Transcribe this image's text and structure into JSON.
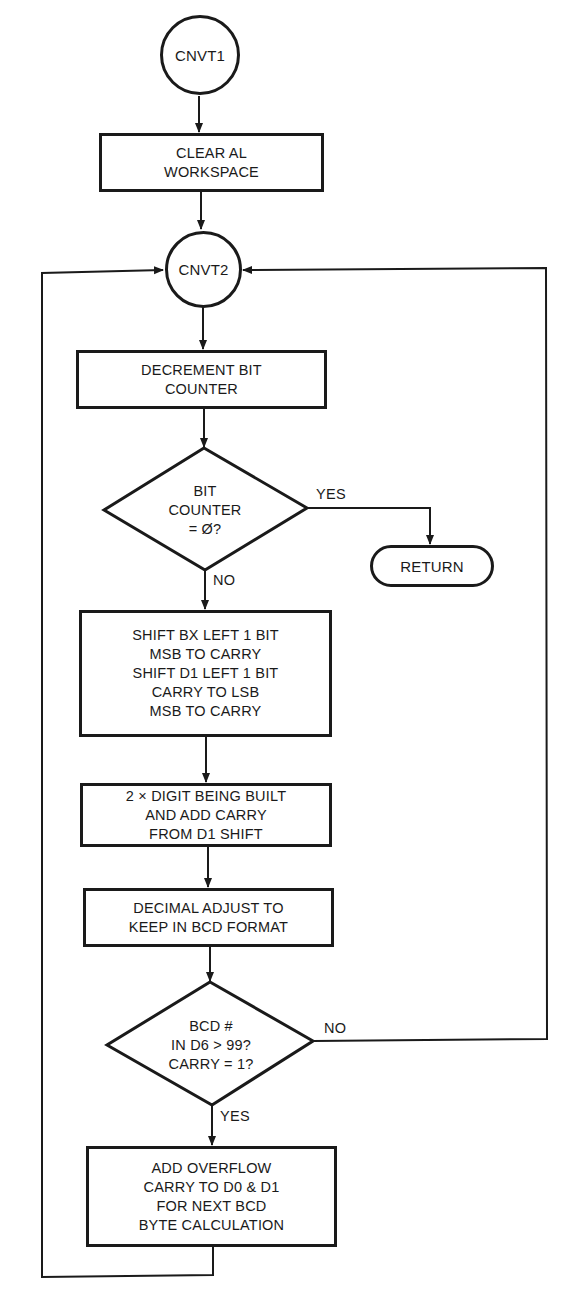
{
  "diagram": {
    "type": "flowchart",
    "nodes": {
      "cnvt1": {
        "shape": "circle",
        "label": "CNVT1"
      },
      "clear_al": {
        "shape": "process",
        "label": "CLEAR AL\nWORKSPACE"
      },
      "cnvt2": {
        "shape": "circle",
        "label": "CNVT2"
      },
      "decrement": {
        "shape": "process",
        "label": "DECREMENT BIT\nCOUNTER"
      },
      "bit_counter_check": {
        "shape": "decision",
        "label": "BIT\nCOUNTER\n= Ø?"
      },
      "return": {
        "shape": "terminal",
        "label": "RETURN"
      },
      "shift": {
        "shape": "process",
        "label": "SHIFT BX LEFT 1 BIT\nMSB TO CARRY\nSHIFT D1 LEFT 1 BIT\nCARRY TO LSB\nMSB TO CARRY"
      },
      "double_digit": {
        "shape": "process",
        "label": "2 × DIGIT BEING BUILT\nAND ADD CARRY\nFROM D1 SHIFT"
      },
      "decimal_adjust": {
        "shape": "process",
        "label": "DECIMAL ADJUST TO\nKEEP IN BCD FORMAT"
      },
      "bcd_check": {
        "shape": "decision",
        "label": "BCD #\nIN D6 > 99?\nCARRY = 1?"
      },
      "add_overflow": {
        "shape": "process",
        "label": "ADD OVERFLOW\nCARRY TO D0 & D1\nFOR NEXT BCD\nBYTE CALCULATION"
      }
    },
    "edge_labels": {
      "bit_counter_yes": "YES",
      "bit_counter_no": "NO",
      "bcd_no": "NO",
      "bcd_yes": "YES"
    },
    "edges": [
      {
        "from": "cnvt1",
        "to": "clear_al"
      },
      {
        "from": "clear_al",
        "to": "cnvt2"
      },
      {
        "from": "cnvt2",
        "to": "decrement"
      },
      {
        "from": "decrement",
        "to": "bit_counter_check"
      },
      {
        "from": "bit_counter_check",
        "to": "return",
        "label": "YES"
      },
      {
        "from": "bit_counter_check",
        "to": "shift",
        "label": "NO"
      },
      {
        "from": "shift",
        "to": "double_digit"
      },
      {
        "from": "double_digit",
        "to": "decimal_adjust"
      },
      {
        "from": "decimal_adjust",
        "to": "bcd_check"
      },
      {
        "from": "bcd_check",
        "to": "cnvt2",
        "label": "NO"
      },
      {
        "from": "bcd_check",
        "to": "add_overflow",
        "label": "YES"
      },
      {
        "from": "add_overflow",
        "to": "cnvt2"
      }
    ]
  }
}
